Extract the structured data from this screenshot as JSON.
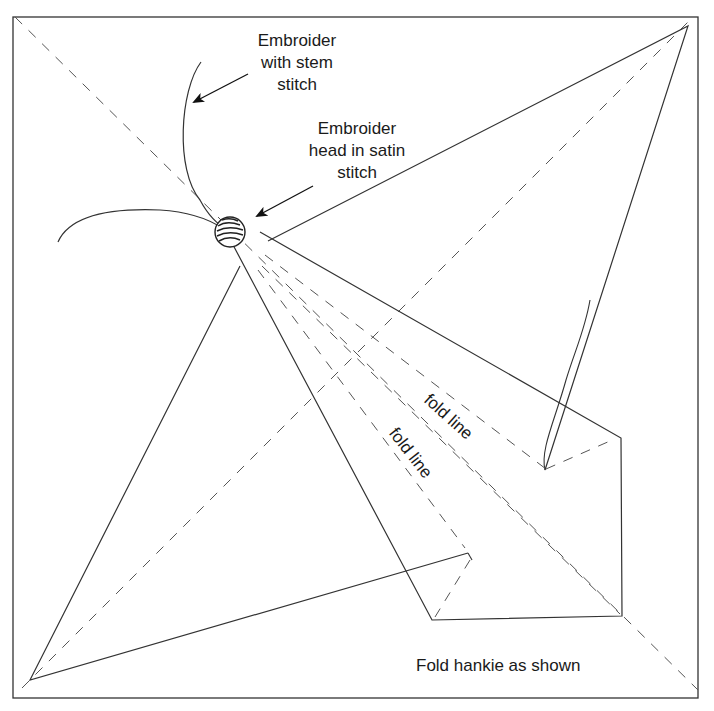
{
  "diagram": {
    "title": "Fold hankie as shown",
    "labels": {
      "stem": [
        "Embroider",
        "with stem",
        "stitch"
      ],
      "head": [
        "Embroider",
        "head in satin",
        "stitch"
      ],
      "fold_line_1": "fold line",
      "fold_line_2": "fold line",
      "caption": "Fold hankie as shown"
    },
    "colors": {
      "line": "#333333",
      "dash": "#555555",
      "background": "#ffffff"
    }
  }
}
